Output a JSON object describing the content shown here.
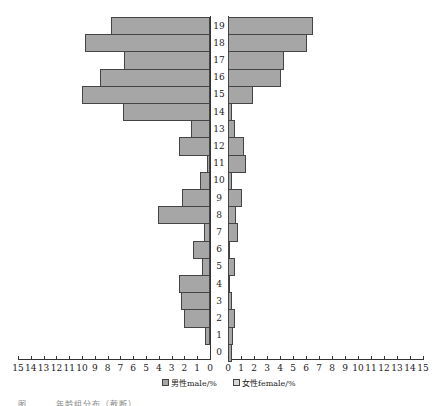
{
  "chart_data": {
    "type": "bar",
    "orientation": "horizontal",
    "subtype": "population-pyramid",
    "categories": [
      "0",
      "1",
      "2",
      "3",
      "4",
      "5",
      "6",
      "7",
      "8",
      "9",
      "10",
      "11",
      "12",
      "13",
      "14",
      "15",
      "16",
      "17",
      "18",
      "19"
    ],
    "series": [
      {
        "name": "男性male/%",
        "side": "left",
        "values": [
          0,
          0.4,
          2.0,
          2.3,
          2.4,
          0.6,
          1.3,
          0.5,
          4.1,
          2.2,
          0.8,
          0.2,
          2.4,
          1.5,
          6.8,
          10.0,
          8.6,
          6.7,
          9.8,
          7.7
        ]
      },
      {
        "name": "女性female/%",
        "side": "right",
        "values": [
          0.3,
          0.4,
          0.5,
          0.3,
          0.05,
          0.5,
          0.1,
          0.8,
          0.6,
          1.1,
          0.3,
          1.4,
          1.2,
          0.5,
          0.3,
          1.9,
          4.1,
          4.3,
          6.1,
          6.5
        ]
      }
    ],
    "xlim": [
      0,
      15
    ],
    "left_ticks": [
      "15",
      "14",
      "13",
      "12",
      "11",
      "10",
      "9",
      "8",
      "7",
      "6",
      "5",
      "4",
      "3",
      "2",
      "1",
      "0"
    ],
    "right_ticks": [
      "0",
      "1",
      "2",
      "3",
      "4",
      "5",
      "6",
      "7",
      "8",
      "9",
      "10",
      "11",
      "12",
      "13",
      "14",
      "15"
    ],
    "legend": [
      "男性male/%",
      "女性female/%"
    ],
    "legend_position": "bottom",
    "grid": false,
    "bar_color": "#a6a6a6"
  },
  "legend": {
    "male": "男性male/%",
    "female": "女性female/%"
  },
  "caption": "图 … … 年龄组分布（截断）"
}
